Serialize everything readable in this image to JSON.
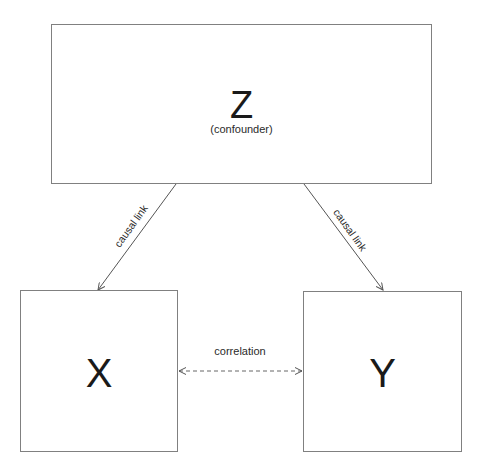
{
  "diagram": {
    "type": "causal-confounder",
    "nodes": {
      "z": {
        "label": "Z",
        "sublabel": "(confounder)"
      },
      "x": {
        "label": "X"
      },
      "y": {
        "label": "Y"
      }
    },
    "edges": [
      {
        "from": "Z",
        "to": "X",
        "style": "solid",
        "direction": "forward",
        "label": "causal link"
      },
      {
        "from": "Z",
        "to": "Y",
        "style": "solid",
        "direction": "forward",
        "label": "causal link"
      },
      {
        "from": "X",
        "to": "Y",
        "style": "dashed",
        "direction": "both",
        "label": "correlation"
      }
    ],
    "colors": {
      "node_border": "#808080",
      "edge": "#555555",
      "text": "#1a1a1a",
      "background": "#ffffff"
    }
  }
}
